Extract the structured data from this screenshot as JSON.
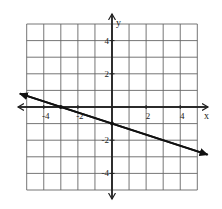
{
  "chart_data": {
    "type": "line",
    "title": "",
    "xlabel": "x",
    "ylabel": "y",
    "xlim": [
      -5,
      5
    ],
    "ylim": [
      -5,
      5
    ],
    "grid": true,
    "grid_step": 1,
    "x_tick_labels": [
      "-4",
      "-2",
      "2",
      "4"
    ],
    "x_tick_values": [
      -4,
      -2,
      2,
      4
    ],
    "y_tick_labels": [
      "4",
      "2",
      "-2",
      "-4"
    ],
    "y_tick_values": [
      4,
      2,
      -2,
      -4
    ],
    "series": [
      {
        "name": "line",
        "equation": "y = -1/3 x - 1",
        "slope": -0.3333,
        "intercept": -1,
        "marked_points": [
          [
            -3,
            0
          ],
          [
            0,
            -1
          ]
        ],
        "arrow_ends": [
          [
            -5.4,
            0.8
          ],
          [
            5.6,
            -2.87
          ]
        ],
        "color": "#111111"
      }
    ],
    "legend": null
  },
  "colors": {
    "grid": "#555555",
    "axis": "#222222",
    "line": "#111111",
    "background": "#ffffff"
  }
}
